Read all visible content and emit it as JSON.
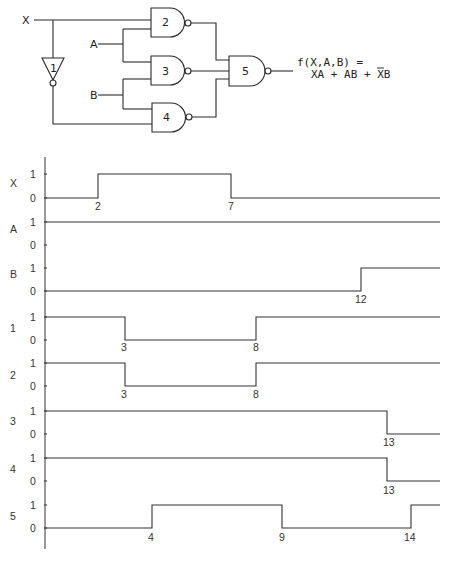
{
  "circuit": {
    "inputs": [
      "X",
      "A",
      "B"
    ],
    "gates": [
      {
        "id": "1",
        "type": "NOT",
        "inputs": [
          "X"
        ]
      },
      {
        "id": "2",
        "type": "NAND",
        "inputs": [
          "X",
          "A"
        ]
      },
      {
        "id": "3",
        "type": "NAND",
        "inputs": [
          "A",
          "B"
        ]
      },
      {
        "id": "4",
        "type": "NAND",
        "inputs": [
          "B",
          "1"
        ]
      },
      {
        "id": "5",
        "type": "NAND",
        "inputs": [
          "2",
          "3",
          "4"
        ]
      }
    ],
    "labels": {
      "x": "X",
      "a": "A",
      "b": "B",
      "g1": "1",
      "g2": "2",
      "g3": "3",
      "g4": "4",
      "g5": "5"
    },
    "output_expr_line1": "f(X,A,B) =",
    "output_expr_line2": "XA + AB + XB",
    "output_expr_overbar": "X (in third term)"
  },
  "timing": {
    "level_labels": {
      "high": "1",
      "low": "0"
    },
    "signals": [
      {
        "name": "X",
        "initial": 0,
        "transitions": [
          {
            "t": 2,
            "to": 1
          },
          {
            "t": 7,
            "to": 0
          }
        ]
      },
      {
        "name": "A",
        "initial": 1,
        "transitions": []
      },
      {
        "name": "B",
        "initial": 0,
        "transitions": [
          {
            "t": 12,
            "to": 1
          }
        ]
      },
      {
        "name": "1",
        "initial": 1,
        "transitions": [
          {
            "t": 3,
            "to": 0
          },
          {
            "t": 8,
            "to": 1
          }
        ]
      },
      {
        "name": "2",
        "initial": 1,
        "transitions": [
          {
            "t": 3,
            "to": 0
          },
          {
            "t": 8,
            "to": 1
          }
        ]
      },
      {
        "name": "3",
        "initial": 1,
        "transitions": [
          {
            "t": 13,
            "to": 0
          }
        ]
      },
      {
        "name": "4",
        "initial": 1,
        "transitions": [
          {
            "t": 13,
            "to": 0
          }
        ]
      },
      {
        "name": "5",
        "initial": 0,
        "transitions": [
          {
            "t": 4,
            "to": 1
          },
          {
            "t": 9,
            "to": 0
          },
          {
            "t": 14,
            "to": 1
          }
        ]
      }
    ],
    "time_markers": {
      "X": [
        "2",
        "7"
      ],
      "B": [
        "12"
      ],
      "1": [
        "3",
        "8"
      ],
      "2": [
        "3",
        "8"
      ],
      "3": [
        "13"
      ],
      "4": [
        "13"
      ],
      "5": [
        "4",
        "9",
        "14"
      ]
    }
  }
}
